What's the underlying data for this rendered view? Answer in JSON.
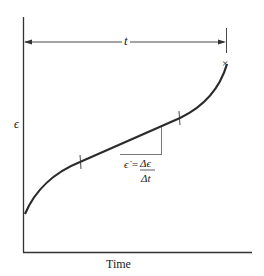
{
  "diagram": {
    "y_axis_label": "ϵ",
    "x_axis_label": "Time",
    "duration_label": "t",
    "rate_formula": {
      "lhs": "ϵ̇ =",
      "numerator": "Δϵ",
      "denominator": "Δt"
    },
    "rupture_marker": "×",
    "colors": {
      "line": "#333333",
      "curve": "#2b2b2b",
      "background": "#ffffff"
    }
  }
}
